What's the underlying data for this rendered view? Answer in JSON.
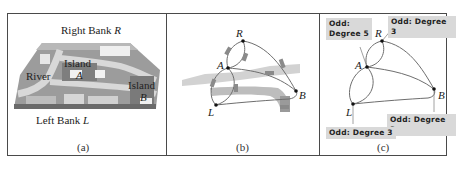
{
  "figure": {
    "panels": [
      {
        "id": "a",
        "caption": "(a)",
        "labels": {
          "right_bank": "Right Bank",
          "right_bank_var": "R",
          "river": "River",
          "island_a": "Island",
          "island_a_var": "A",
          "island_b": "Island",
          "island_b_var": "B",
          "left_bank": "Left Bank",
          "left_bank_var": "L"
        }
      },
      {
        "id": "b",
        "caption": "(b)",
        "nodes": [
          "R",
          "A",
          "B",
          "L"
        ]
      },
      {
        "id": "c",
        "caption": "(c)",
        "nodes": [
          "R",
          "A",
          "B",
          "L"
        ],
        "callouts": {
          "A_line1": "Odd:",
          "A_line2": "Degree 5",
          "R": "Odd: Degree 3",
          "B": "Odd: Degree 3",
          "L": "Odd: Degree 3"
        }
      }
    ],
    "colors": {
      "border": "#4a4a4a",
      "edge": "#6e6e6e",
      "node": "#111111",
      "callout_bg": "#d9d9d9",
      "river": "#c8c8c8",
      "bridge": "#8a8a8a"
    }
  }
}
